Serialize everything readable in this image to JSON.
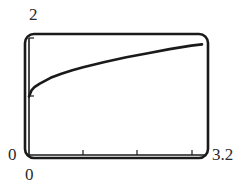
{
  "chart_data": {
    "type": "line",
    "title": "",
    "xlabel": "",
    "ylabel": "",
    "xlim": [
      0,
      3.2
    ],
    "ylim": [
      0,
      2
    ],
    "x_ticks": [
      1,
      2,
      3
    ],
    "y_ticks": [
      1,
      2
    ],
    "grid": false,
    "legend": null,
    "window_labels": {
      "x_min": "0",
      "x_max": "3.2",
      "y_min": "0",
      "y_max": "2"
    },
    "series": [
      {
        "name": "curve",
        "x": [
          0,
          0.05,
          0.1,
          0.2,
          0.4,
          0.6,
          0.8,
          1.0,
          1.4,
          1.8,
          2.2,
          2.6,
          3.0,
          3.2
        ],
        "y": [
          1.0,
          1.11,
          1.16,
          1.22,
          1.32,
          1.39,
          1.45,
          1.5,
          1.59,
          1.67,
          1.74,
          1.81,
          1.87,
          1.89
        ]
      }
    ]
  },
  "labels": {
    "y_max": "2",
    "y_min": "0",
    "x_min": "0",
    "x_max": "3.2"
  },
  "colors": {
    "ink": "#1a1a1a"
  }
}
